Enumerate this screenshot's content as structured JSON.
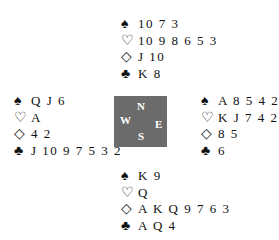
{
  "hands": {
    "north": {
      "spades": "1073",
      "hearts": "1098653",
      "diamonds": "J10",
      "clubs": "K8"
    },
    "west": {
      "spades": "QJ6",
      "hearts": "A",
      "diamonds": "42",
      "clubs": "J1097532"
    },
    "east": {
      "spades": "A8542",
      "hearts": "KJ742",
      "diamonds": "85",
      "clubs": "6"
    },
    "south": {
      "spades": "K9",
      "hearts": "Q",
      "diamonds": "AKQ9763",
      "clubs": "AQ4"
    }
  },
  "display": {
    "north": {
      "spades": "10 7 3",
      "hearts": "10 9 8 6 5 3",
      "diamonds": "J 10",
      "clubs": "K 8"
    },
    "west": {
      "spades": "Q J 6",
      "hearts": "A",
      "diamonds": "4 2",
      "clubs": "J 10 9 7 5 3 2"
    },
    "east": {
      "spades": "A 8 5 4 2",
      "hearts": "K J 7 4 2",
      "diamonds": "8 5",
      "clubs": "6"
    },
    "south": {
      "spades": "K 9",
      "hearts": "Q",
      "diamonds": "A K Q 9 7 6 3",
      "clubs": "A Q 4"
    }
  },
  "symbols": {
    "spade": "♠",
    "heart": "♡",
    "diamond": "◇",
    "club": "♣"
  },
  "compass": {
    "n": "N",
    "s": "S",
    "w": "W",
    "e": "E",
    "color": "#6b6b6b"
  }
}
